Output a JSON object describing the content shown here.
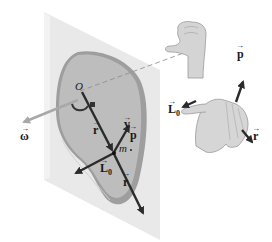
{
  "figure": {
    "type": "physics-diagram",
    "colors": {
      "background": "#ffffff",
      "plane": "#e9e9e9",
      "plane_edge": "#d8d8d8",
      "disk_face": "#bdbdbd",
      "disk_rim": "#9e9e9e",
      "vector": "#2b2b2b",
      "omega_vector": "#a8a8a8",
      "hand": "#d4d4d4",
      "hand_outline": "#9a9a9a"
    }
  },
  "labels": {
    "origin": "O",
    "omega": "ω",
    "r_upper": "r",
    "v": "v",
    "p_body": "p",
    "mass": "m",
    "L0_body": "L",
    "L0_body_sub": "0",
    "r_lower": "r",
    "p_hand": "p",
    "L0_hand": "L",
    "L0_hand_sub": "0",
    "r_hand": "r",
    "arrow_mark": "→"
  },
  "hands": {
    "upper": "right-hand thumb pointing along rotation axis",
    "lower": "right-hand rule: fingers curl from r to p, thumb along L0"
  }
}
